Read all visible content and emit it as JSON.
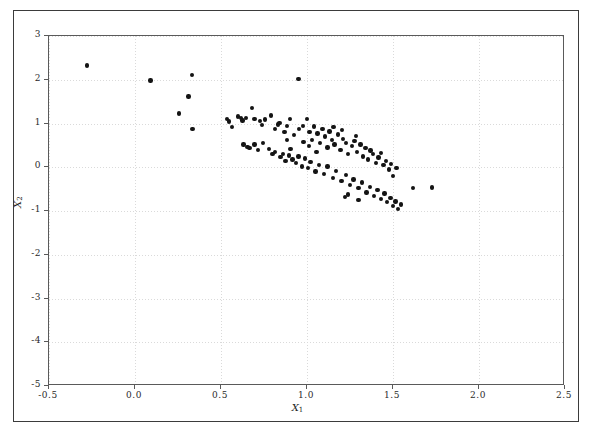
{
  "figure": {
    "background": "#ffffff",
    "frame_color": "#3b3b3b",
    "axes_color": "#5a5a5a",
    "grid_color": "#dadada",
    "marker_color": "#141414"
  },
  "axis": {
    "xlabel": "X",
    "xlabel_sub": "1",
    "ylabel": "X",
    "ylabel_sub": "2",
    "x_ticklabels": [
      "-0.5",
      "0.0",
      "0.5",
      "1.0",
      "1.5",
      "2.0",
      "2.5"
    ],
    "y_ticklabels": [
      "-5",
      "-4",
      "-3",
      "-2",
      "-1",
      "0",
      "1",
      "2",
      "3"
    ]
  },
  "chart_data": {
    "type": "scatter",
    "title": "",
    "xlabel": "X1",
    "ylabel": "X2",
    "xlim": [
      -0.5,
      2.5
    ],
    "ylim": [
      -5,
      3
    ],
    "xticks": [
      -0.5,
      0.0,
      0.5,
      1.0,
      1.5,
      2.0,
      2.5
    ],
    "yticks": [
      -5,
      -4,
      -3,
      -2,
      -1,
      0,
      1,
      2,
      3
    ],
    "grid": true,
    "legend": null,
    "marker": "filled-circle",
    "series": [
      {
        "name": "data",
        "points": [
          [
            -0.28,
            2.33
          ],
          [
            0.09,
            1.98
          ],
          [
            0.33,
            2.11
          ],
          [
            0.31,
            1.62
          ],
          [
            0.255,
            1.23
          ],
          [
            0.335,
            0.88
          ],
          [
            0.535,
            1.11
          ],
          [
            0.545,
            1.05
          ],
          [
            0.565,
            0.92
          ],
          [
            0.6,
            1.16
          ],
          [
            0.615,
            1.12
          ],
          [
            0.625,
            1.07
          ],
          [
            0.645,
            1.13
          ],
          [
            0.68,
            1.35
          ],
          [
            0.695,
            1.1
          ],
          [
            0.725,
            1.06
          ],
          [
            0.74,
            0.97
          ],
          [
            0.755,
            1.09
          ],
          [
            0.79,
            1.18
          ],
          [
            0.815,
            0.88
          ],
          [
            0.83,
            0.98
          ],
          [
            0.84,
            1.01
          ],
          [
            0.87,
            0.8
          ],
          [
            0.885,
            0.95
          ],
          [
            0.9,
            1.1
          ],
          [
            0.925,
            0.74
          ],
          [
            0.95,
            2.02
          ],
          [
            0.955,
            0.88
          ],
          [
            0.975,
            0.95
          ],
          [
            0.98,
            0.58
          ],
          [
            1.0,
            1.11
          ],
          [
            1.015,
            0.8
          ],
          [
            1.03,
            0.63
          ],
          [
            1.04,
            0.93
          ],
          [
            1.06,
            0.77
          ],
          [
            1.075,
            0.55
          ],
          [
            1.09,
            0.88
          ],
          [
            1.105,
            0.7
          ],
          [
            1.12,
            0.45
          ],
          [
            1.13,
            0.82
          ],
          [
            1.145,
            0.62
          ],
          [
            1.16,
            0.52
          ],
          [
            1.18,
            0.75
          ],
          [
            1.195,
            0.4
          ],
          [
            1.21,
            0.65
          ],
          [
            1.225,
            0.55
          ],
          [
            1.24,
            0.3
          ],
          [
            1.26,
            0.48
          ],
          [
            1.275,
            0.6
          ],
          [
            1.29,
            0.35
          ],
          [
            1.31,
            0.52
          ],
          [
            1.325,
            0.25
          ],
          [
            1.34,
            0.44
          ],
          [
            1.355,
            0.18
          ],
          [
            1.37,
            0.38
          ],
          [
            1.385,
            0.3
          ],
          [
            1.4,
            0.1
          ],
          [
            1.415,
            0.22
          ],
          [
            1.43,
            0.32
          ],
          [
            1.445,
            0.05
          ],
          [
            1.46,
            0.15
          ],
          [
            1.475,
            -0.05
          ],
          [
            1.49,
            0.08
          ],
          [
            1.5,
            -0.2
          ],
          [
            1.52,
            -0.02
          ],
          [
            0.63,
            0.52
          ],
          [
            0.655,
            0.47
          ],
          [
            0.665,
            0.44
          ],
          [
            0.695,
            0.52
          ],
          [
            0.715,
            0.4
          ],
          [
            0.745,
            0.56
          ],
          [
            0.78,
            0.42
          ],
          [
            0.8,
            0.3
          ],
          [
            0.815,
            0.35
          ],
          [
            0.845,
            0.23
          ],
          [
            0.86,
            0.3
          ],
          [
            0.875,
            0.15
          ],
          [
            0.895,
            0.27
          ],
          [
            0.915,
            0.18
          ],
          [
            0.935,
            0.1
          ],
          [
            0.95,
            0.25
          ],
          [
            0.97,
            0.02
          ],
          [
            0.99,
            0.2
          ],
          [
            1.005,
            -0.02
          ],
          [
            1.02,
            0.12
          ],
          [
            1.05,
            -0.1
          ],
          [
            1.07,
            0.05
          ],
          [
            1.1,
            -0.15
          ],
          [
            1.12,
            0.02
          ],
          [
            1.15,
            -0.25
          ],
          [
            1.17,
            -0.08
          ],
          [
            1.2,
            -0.32
          ],
          [
            1.225,
            -0.18
          ],
          [
            1.25,
            -0.4
          ],
          [
            1.27,
            -0.28
          ],
          [
            1.3,
            -0.48
          ],
          [
            1.32,
            -0.35
          ],
          [
            1.345,
            -0.58
          ],
          [
            1.365,
            -0.45
          ],
          [
            1.39,
            -0.66
          ],
          [
            1.41,
            -0.52
          ],
          [
            1.43,
            -0.72
          ],
          [
            1.45,
            -0.6
          ],
          [
            1.465,
            -0.8
          ],
          [
            1.485,
            -0.7
          ],
          [
            1.5,
            -0.88
          ],
          [
            1.515,
            -0.78
          ],
          [
            1.53,
            -0.95
          ],
          [
            1.545,
            -0.85
          ],
          [
            1.3,
            -0.75
          ],
          [
            1.24,
            -0.62
          ],
          [
            1.22,
            -0.68
          ],
          [
            1.615,
            -0.48
          ],
          [
            1.725,
            -0.46
          ],
          [
            1.055,
            0.35
          ],
          [
            0.885,
            0.62
          ],
          [
            0.905,
            0.42
          ],
          [
            1.155,
            0.92
          ],
          [
            1.205,
            0.85
          ],
          [
            1.285,
            0.72
          ],
          [
            1.01,
            0.48
          ]
        ]
      }
    ]
  }
}
